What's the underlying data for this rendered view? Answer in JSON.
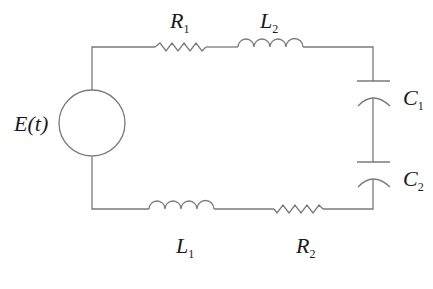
{
  "diagram": {
    "type": "series RLC circuit",
    "source": {
      "label": "E(t)",
      "symbol": "E",
      "arg": "(t)"
    },
    "components": [
      {
        "id": "R1",
        "kind": "resistor",
        "letter": "R",
        "sub": "1",
        "position": "top-left"
      },
      {
        "id": "L2",
        "kind": "inductor",
        "letter": "L",
        "sub": "2",
        "position": "top-right"
      },
      {
        "id": "C1",
        "kind": "capacitor",
        "letter": "C",
        "sub": "1",
        "position": "right-upper"
      },
      {
        "id": "C2",
        "kind": "capacitor",
        "letter": "C",
        "sub": "2",
        "position": "right-lower"
      },
      {
        "id": "L1",
        "kind": "inductor",
        "letter": "L",
        "sub": "1",
        "position": "bottom-left"
      },
      {
        "id": "R2",
        "kind": "resistor",
        "letter": "R",
        "sub": "2",
        "position": "bottom-right"
      }
    ],
    "colors": {
      "wire": "#7a7a7a",
      "text": "#1a1a1a",
      "background": "#ffffff"
    }
  }
}
